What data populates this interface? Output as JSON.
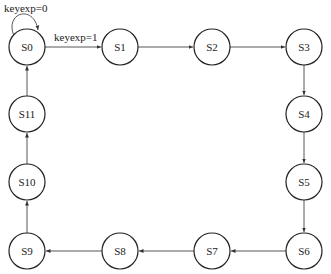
{
  "diagram": {
    "type": "state-machine",
    "states": [
      {
        "id": "S0",
        "label": "S0",
        "x": 27,
        "y": 47
      },
      {
        "id": "S1",
        "label": "S1",
        "x": 120,
        "y": 47
      },
      {
        "id": "S2",
        "label": "S2",
        "x": 212,
        "y": 47
      },
      {
        "id": "S3",
        "label": "S3",
        "x": 304,
        "y": 47
      },
      {
        "id": "S4",
        "label": "S4",
        "x": 304,
        "y": 114
      },
      {
        "id": "S5",
        "label": "S5",
        "x": 304,
        "y": 182
      },
      {
        "id": "S6",
        "label": "S6",
        "x": 304,
        "y": 251
      },
      {
        "id": "S7",
        "label": "S7",
        "x": 212,
        "y": 251
      },
      {
        "id": "S8",
        "label": "S8",
        "x": 120,
        "y": 251
      },
      {
        "id": "S9",
        "label": "S9",
        "x": 27,
        "y": 251
      },
      {
        "id": "S10",
        "label": "S10",
        "x": 27,
        "y": 182
      },
      {
        "id": "S11",
        "label": "S11",
        "x": 27,
        "y": 114
      }
    ],
    "transitions": [
      {
        "from": "S0",
        "to": "S0",
        "label": "keyexp=0"
      },
      {
        "from": "S0",
        "to": "S1",
        "label": "keyexp=1"
      },
      {
        "from": "S1",
        "to": "S2",
        "label": ""
      },
      {
        "from": "S2",
        "to": "S3",
        "label": ""
      },
      {
        "from": "S3",
        "to": "S4",
        "label": ""
      },
      {
        "from": "S4",
        "to": "S5",
        "label": ""
      },
      {
        "from": "S5",
        "to": "S6",
        "label": ""
      },
      {
        "from": "S6",
        "to": "S7",
        "label": ""
      },
      {
        "from": "S7",
        "to": "S8",
        "label": ""
      },
      {
        "from": "S8",
        "to": "S9",
        "label": ""
      },
      {
        "from": "S9",
        "to": "S10",
        "label": ""
      },
      {
        "from": "S10",
        "to": "S11",
        "label": ""
      },
      {
        "from": "S11",
        "to": "S0",
        "label": ""
      }
    ],
    "labels": {
      "self_loop": "keyexp=0",
      "s0_to_s1": "keyexp=1"
    }
  }
}
